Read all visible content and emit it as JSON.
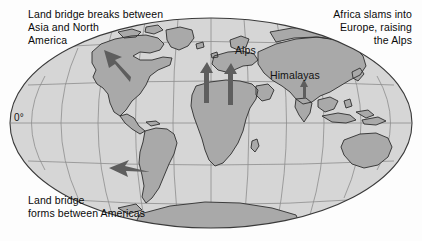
{
  "figure": {
    "kind": "world-map",
    "projection": "mollweide-ellipse",
    "background_color": "#fdfdfd"
  },
  "colors": {
    "ocean": "#d6d6d6",
    "land": "#a9a9a9",
    "coastline": "#2e2e2e",
    "graticule": "#8d8d8d",
    "globe_outline": "#3a3a3a",
    "arrow": "#5e5e5e",
    "text": "#0a0a0a"
  },
  "annotations": [
    {
      "id": "land-bridge-breaks",
      "position": "top-left",
      "text": "Land bridge breaks between\nAsia and North\nAmerica"
    },
    {
      "id": "africa-slams",
      "position": "top-right",
      "text": "Africa slams into\nEurope, raising\nthe Alps"
    },
    {
      "id": "land-bridge-forms",
      "position": "bottom-left",
      "text": "Land bridge\nforms between Americas"
    }
  ],
  "map_labels": [
    {
      "id": "alps",
      "text": "Alps"
    },
    {
      "id": "himalayas",
      "text": "Himalayas"
    },
    {
      "id": "equator",
      "text": "0°"
    }
  ],
  "arrows": [
    {
      "id": "bering-northwest",
      "direction": "northwest",
      "region": "Bering / Alaska"
    },
    {
      "id": "south-america-west",
      "direction": "west",
      "region": "South America"
    },
    {
      "id": "africa-north-west",
      "direction": "north",
      "region": "West Africa to Europe"
    },
    {
      "id": "africa-north-east",
      "direction": "north",
      "region": "East Africa to Europe"
    },
    {
      "id": "india-north",
      "direction": "north",
      "region": "India to Himalayas"
    }
  ]
}
